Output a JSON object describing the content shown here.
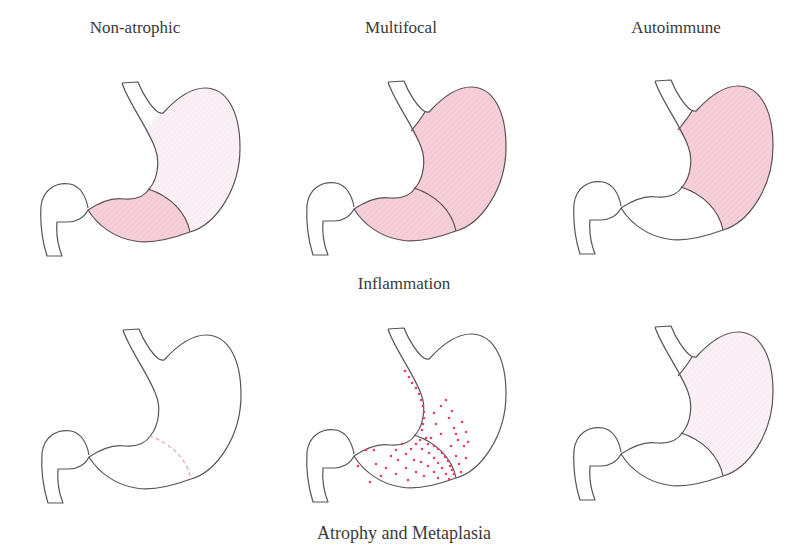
{
  "colors": {
    "outline": "#5a5258",
    "pink_strong": "#f6cfd8",
    "pink_light": "#f9eff5",
    "dot": "#e8405f",
    "dashed": "#e7a0b0"
  },
  "column_headers": [
    {
      "label": "Non-atrophic",
      "x": 135,
      "y": 18
    },
    {
      "label": "Multifocal",
      "x": 401,
      "y": 18
    },
    {
      "label": "Autoimmune",
      "x": 676,
      "y": 18
    }
  ],
  "row_labels": {
    "row1": {
      "label": "Inflammation",
      "x": 404,
      "y": 274
    },
    "row2": {
      "label": "Atrophy and Metaplasia",
      "x": 404,
      "y": 523
    }
  },
  "panels": [
    {
      "id": "non-atrophic-inflammation",
      "row": 1,
      "col": 1,
      "antrum": "strong",
      "body": "light",
      "cardia_line": false,
      "antrum_line": "solid"
    },
    {
      "id": "multifocal-inflammation",
      "row": 1,
      "col": 2,
      "antrum": "strong",
      "body": "strong",
      "cardia_line": true,
      "antrum_line": "solid"
    },
    {
      "id": "autoimmune-inflammation",
      "row": 1,
      "col": 3,
      "antrum": "none",
      "body": "strong",
      "cardia_line": true,
      "antrum_line": "solid"
    },
    {
      "id": "non-atrophic-atrophy",
      "row": 2,
      "col": 1,
      "antrum": "none",
      "body": "none",
      "cardia_line": false,
      "antrum_line": "dashed"
    },
    {
      "id": "multifocal-atrophy",
      "row": 2,
      "col": 2,
      "antrum": "none",
      "body": "none",
      "cardia_line": false,
      "antrum_line": "solid",
      "dots": true
    },
    {
      "id": "autoimmune-atrophy",
      "row": 2,
      "col": 3,
      "antrum": "none",
      "body": "light",
      "cardia_line": true,
      "antrum_line": "solid"
    }
  ]
}
